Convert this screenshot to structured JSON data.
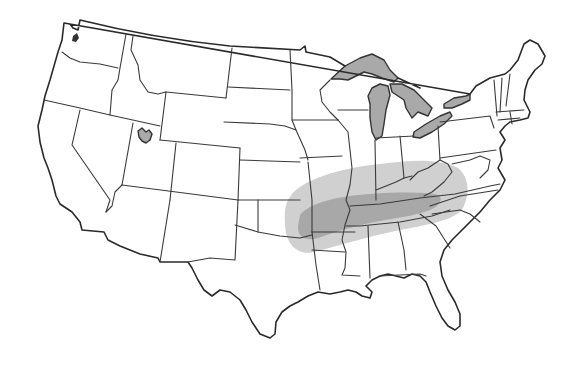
{
  "map": {
    "title": "",
    "subject": "Contiguous United States with state boundaries",
    "background_color": "#ffffff",
    "boundary_color": "#3a3a3a",
    "water_bodies": [
      {
        "name": "Lake Superior",
        "fill": "#a9a9a9"
      },
      {
        "name": "Lake Michigan",
        "fill": "#a9a9a9"
      },
      {
        "name": "Lake Huron",
        "fill": "#a9a9a9"
      },
      {
        "name": "Lake Erie",
        "fill": "#a9a9a9"
      },
      {
        "name": "Lake Ontario",
        "fill": "#a9a9a9"
      },
      {
        "name": "Great Salt Lake",
        "fill": "#a9a9a9"
      },
      {
        "name": "Puget Sound",
        "fill": "#333333"
      }
    ],
    "shaded_region": {
      "outer_zone": {
        "fill": "#cfcfcf",
        "description": "Light gray ellipse spanning eastern Oklahoma/Kansas to western North Carolina, covering Missouri, Illinois, Indiana, Ohio, Kentucky, West Virginia, Virginia, Arkansas, Tennessee, northern Mississippi/Alabama/Georgia"
      },
      "inner_zone": {
        "fill": "#a6a6a6",
        "description": "Darker gray core band over Arkansas, Tennessee and southern Kentucky"
      }
    },
    "labels": []
  }
}
